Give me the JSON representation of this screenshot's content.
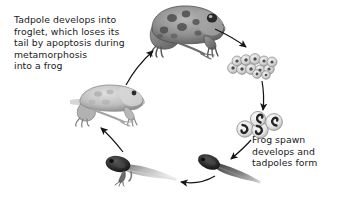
{
  "figure": {
    "background_color": "#ffffff",
    "text_color": "#1a1a1a",
    "arrow_color": "#141414"
  },
  "captions": {
    "left": {
      "text": "Tadpole develops into\nfroglet, which loses its\ntail by apoptosis during\nmetamorphosis\ninto a frog",
      "lines": [
        "Tadpole develops into",
        "froglet, which loses its",
        "tail by apoptosis during",
        "metamorphosis",
        "into a frog"
      ]
    },
    "right": {
      "text": "Frog spawn\ndevelops and\ntadpoles form",
      "lines": [
        "Frog spawn",
        "develops and",
        "tadpoles form"
      ]
    }
  },
  "stages": [
    {
      "id": "adult-frog",
      "label": "Adult frog",
      "position": "top-center-right",
      "description": "Spotted adult frog facing right, grayscale photo"
    },
    {
      "id": "frog-spawn",
      "label": "Frog spawn",
      "position": "right-upper",
      "description": "Cluster of small round eggs",
      "egg_count": 12
    },
    {
      "id": "developing-embryos",
      "label": "Developing embryos",
      "position": "right-middle",
      "description": "Four eggs containing comma-shaped embryos",
      "egg_count": 4
    },
    {
      "id": "tadpole",
      "label": "Tadpole",
      "position": "bottom-right",
      "description": "Dark legless tadpole with long tail"
    },
    {
      "id": "tadpole-with-legs",
      "label": "Tadpole with hind legs",
      "position": "bottom-left",
      "description": "Tadpole with developing hind legs and pale tail"
    },
    {
      "id": "froglet",
      "label": "Froglet",
      "position": "left-middle",
      "description": "Pale young frog with legs and shrinking tail"
    }
  ],
  "arrows": [
    {
      "id": "arrow-frog-to-spawn",
      "from": "adult-frog",
      "to": "frog-spawn"
    },
    {
      "id": "arrow-spawn-to-embryos",
      "from": "frog-spawn",
      "to": "developing-embryos"
    },
    {
      "id": "arrow-embryos-to-tadpole",
      "from": "developing-embryos",
      "to": "tadpole"
    },
    {
      "id": "arrow-tadpole-to-legged-tadpole",
      "from": "tadpole",
      "to": "tadpole-with-legs"
    },
    {
      "id": "arrow-legged-tadpole-to-froglet",
      "from": "tadpole-with-legs",
      "to": "froglet"
    },
    {
      "id": "arrow-froglet-to-frog",
      "from": "froglet",
      "to": "adult-frog"
    }
  ]
}
